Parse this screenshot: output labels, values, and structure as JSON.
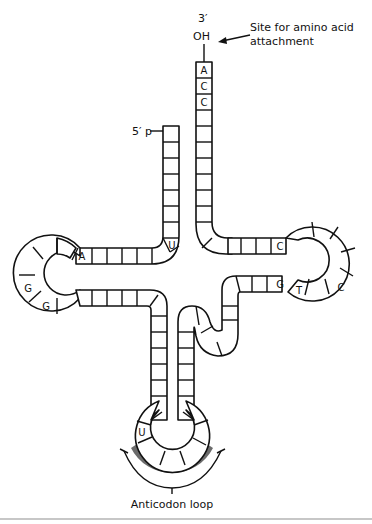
{
  "labels": {
    "three_prime": "3′",
    "oh": "OH",
    "amino_site_line1": "Site for amino acid",
    "amino_site_line2": "attachment",
    "five_prime": "5′ p",
    "anticodon": "Anticodon loop"
  },
  "nucleotides": {
    "acceptor_3prime": [
      "A",
      "C",
      "C"
    ],
    "d_arm_junction": "U",
    "d_loop": [
      "A",
      "G",
      "G"
    ],
    "t_arm": [
      "C",
      "G"
    ],
    "t_loop": [
      "T",
      "C"
    ],
    "anticodon_loop": "U"
  },
  "colors": {
    "line": "#111111",
    "anticodon_band": "#6b6b6b",
    "separator": "#b5b5b5"
  }
}
